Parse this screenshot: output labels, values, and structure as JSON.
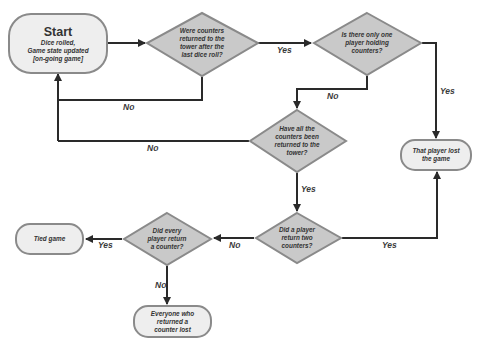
{
  "colors": {
    "terminal_fill": "#eeeeee",
    "terminal_stroke": "#8a8a8a",
    "decision_fill": "#c9c9c9",
    "decision_stroke": "#8a8a8a",
    "line": "#2a2a2a",
    "text": "#333333"
  },
  "nodes": {
    "start": {
      "title": "Start",
      "line1": "Dice rolled,",
      "line2": "Game state updated",
      "line3": "[on-going game]"
    },
    "decision_returned_after_roll": {
      "line1": "Were counters",
      "line2": "returned to the",
      "line3": "tower after the",
      "line4": "last dice roll?"
    },
    "decision_one_player_holding": {
      "line1": "Is there only one",
      "line2": "player holding",
      "line3": "counters?"
    },
    "decision_all_returned": {
      "line1": "Have all the",
      "line2": "counters been",
      "line3": "returned to the",
      "line4": "tower?"
    },
    "player_lost": {
      "line1": "That player lost",
      "line2": "the game"
    },
    "decision_two_counters": {
      "line1": "Did a player",
      "line2": "return two",
      "line3": "counters?"
    },
    "decision_every_player": {
      "line1": "Did every",
      "line2": "player return",
      "line3": "a counter?"
    },
    "tied_game": {
      "line1": "Tied game"
    },
    "everyone_lost": {
      "line1": "Everyone who",
      "line2": "returned a",
      "line3": "counter lost"
    }
  },
  "edges": {
    "d1_yes": "Yes",
    "d1_no": "No",
    "d2_yes": "Yes",
    "d2_no": "No",
    "d3_no": "No",
    "d3_yes": "Yes",
    "d4_yes": "Yes",
    "d4_no": "No",
    "d5_yes": "Yes",
    "d5_no": "No"
  }
}
